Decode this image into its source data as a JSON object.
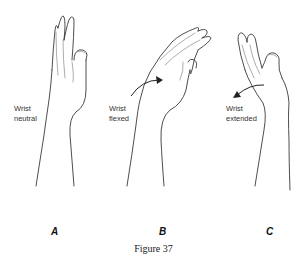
{
  "figure": {
    "caption": "Figure 37",
    "panels": [
      {
        "letter": "A",
        "label": "Wrist\nneutral"
      },
      {
        "letter": "B",
        "label": "Wrist\nflexed"
      },
      {
        "letter": "C",
        "label": "Wrist\nextended"
      }
    ]
  }
}
